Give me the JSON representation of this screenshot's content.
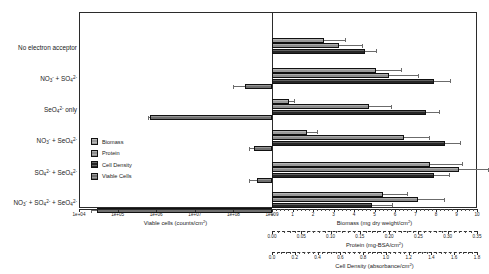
{
  "chart_data": {
    "type": "bar",
    "orientation": "horizontal",
    "title": "",
    "categories": [
      "No electron acceptor",
      "NO3- + SO42-",
      "SeO42- only",
      "NO3- + SeO42-",
      "SO42- + SeO42-",
      "NO3- + SO42- + SeO42-"
    ],
    "categories_display": [
      {
        "text": "No electron acceptor",
        "parts": [
          {
            "t": "No electron acceptor"
          }
        ]
      },
      {
        "text": "NO3- + SO42-",
        "parts": [
          {
            "t": "NO"
          },
          {
            "sub": "3"
          },
          {
            "sup": "-"
          },
          {
            "t": " + SO"
          },
          {
            "sub": "4"
          },
          {
            "sup": "2-"
          }
        ]
      },
      {
        "text": "SeO42- only",
        "parts": [
          {
            "t": "SeO"
          },
          {
            "sub": "4"
          },
          {
            "sup": "2-"
          },
          {
            "t": " only"
          }
        ]
      },
      {
        "text": "NO3- + SeO42-",
        "parts": [
          {
            "t": "NO"
          },
          {
            "sub": "3"
          },
          {
            "sup": "-"
          },
          {
            "t": " + SeO"
          },
          {
            "sub": "4"
          },
          {
            "sup": "2-"
          }
        ]
      },
      {
        "text": "SO42- + SeO42-",
        "parts": [
          {
            "t": "SO"
          },
          {
            "sub": "4"
          },
          {
            "sup": "2-"
          },
          {
            "t": " + SeO"
          },
          {
            "sub": "4"
          },
          {
            "sup": "2-"
          }
        ]
      },
      {
        "text": "NO3- + SO42- + SeO42-",
        "parts": [
          {
            "t": "NO"
          },
          {
            "sub": "3"
          },
          {
            "sup": "-"
          },
          {
            "t": " + SO"
          },
          {
            "sub": "4"
          },
          {
            "sup": "2-"
          },
          {
            "t": " + SeO"
          },
          {
            "sub": "4"
          },
          {
            "sup": "2-"
          }
        ]
      }
    ],
    "legend": {
      "position": "left-center-inside",
      "entries": [
        "Biomass",
        "Protein",
        "Cell Density",
        "Viable Cells"
      ]
    },
    "series": [
      {
        "name": "Biomass",
        "axis": "biomass",
        "direction": "right",
        "unit": "mg dry weight/cm2",
        "values": [
          2.55,
          5.05,
          0.85,
          1.7,
          7.7,
          5.4
        ],
        "errors": [
          1.05,
          1.3,
          0.25,
          0.55,
          1.6,
          1.2
        ]
      },
      {
        "name": "Protein",
        "axis": "protein",
        "direction": "right",
        "unit": "mg-BSA/cm2",
        "values": [
          0.115,
          0.2,
          0.165,
          0.225,
          0.32,
          0.25
        ],
        "errors": [
          0.04,
          0.05,
          0.04,
          0.045,
          0.05,
          0.045
        ]
      },
      {
        "name": "Cell Density",
        "axis": "celldensity",
        "direction": "right",
        "unit": "absorbance/cm2",
        "values": [
          0.82,
          1.42,
          1.35,
          1.52,
          1.42,
          0.88
        ],
        "errors": [
          0.1,
          0.15,
          0.12,
          0.14,
          0.14,
          0.18
        ]
      },
      {
        "name": "Viable Cells",
        "axis": "viablecells",
        "direction": "left",
        "unit": "counts/cm2",
        "values": [
          null,
          200000000.0,
          700000.0,
          350000000.0,
          400000000.0,
          30000.0
        ],
        "errors_low": [
          null,
          100000000.0,
          100000.0,
          100000000.0,
          150000000.0,
          10000.0
        ]
      }
    ],
    "axes": [
      {
        "id": "viablecells",
        "label": "Viable cells (counts/cm2)",
        "label_display": [
          {
            "t": "Viable cells (counts/cm"
          },
          {
            "sup": "2"
          },
          {
            "t": ")"
          }
        ],
        "scale": "log",
        "side": "left",
        "ticks": [
          "1e+04",
          "1e+05",
          "1e+06",
          "1e+07",
          "1e+08",
          "1e+09"
        ],
        "tick_display": [
          [
            {
              "t": "1e+04"
            }
          ],
          [
            {
              "t": "1e+05"
            }
          ],
          [
            {
              "t": "1e+06"
            }
          ],
          [
            {
              "t": "1e+07"
            }
          ],
          [
            {
              "t": "1e+08"
            }
          ],
          [
            {
              "t": "1e+09"
            }
          ]
        ]
      },
      {
        "id": "biomass",
        "label": "Biomass (mg dry weight/cm2)",
        "label_display": [
          {
            "t": "Biomass (mg dry weight/cm"
          },
          {
            "sup": "2"
          },
          {
            "t": ")"
          }
        ],
        "scale": "linear",
        "side": "right",
        "range": [
          0,
          10
        ],
        "ticks": [
          "0",
          "1",
          "2",
          "3",
          "4",
          "5",
          "6",
          "7",
          "8",
          "9",
          "10"
        ]
      },
      {
        "id": "protein",
        "label": "Protein (mg-BSA/cm2)",
        "label_display": [
          {
            "t": "Protein (mg-BSA/cm"
          },
          {
            "sup": "2"
          },
          {
            "t": ")"
          }
        ],
        "scale": "linear",
        "side": "right",
        "range": [
          0,
          0.35
        ],
        "ticks": [
          "0.00",
          "0.05",
          "0.10",
          "0.15",
          "0.20",
          "0.25",
          "0.30",
          "0.35"
        ]
      },
      {
        "id": "celldensity",
        "label": "Cell Density (absorbance/cm2)",
        "label_display": [
          {
            "t": "Cell Density (absorbance/cm"
          },
          {
            "sup": "2"
          },
          {
            "t": ")"
          }
        ],
        "scale": "linear",
        "side": "right",
        "range": [
          0,
          1.8
        ],
        "ticks": [
          "0.0",
          "0.2",
          "0.4",
          "0.6",
          "0.8",
          "1.0",
          "1.2",
          "1.4",
          "1.6",
          "1.8"
        ]
      }
    ],
    "colors": {
      "biomass": "#9a9a9a",
      "protein": "#8d8d8d",
      "celldensity": "#262626",
      "viablecells": "#6f6f6f",
      "axis": "#2b2b2b",
      "error": "#6b6b6b"
    },
    "grid": false
  },
  "layout": {
    "zero_x_px": 272,
    "plot": {
      "left": 79,
      "top": 12,
      "width": 398,
      "height": 196
    },
    "group_centers_px": [
      36,
      66,
      97,
      128,
      160,
      190
    ],
    "bar_px": {
      "biomass_right_end": [
        0,
        0,
        0,
        0,
        0,
        0
      ]
    }
  }
}
